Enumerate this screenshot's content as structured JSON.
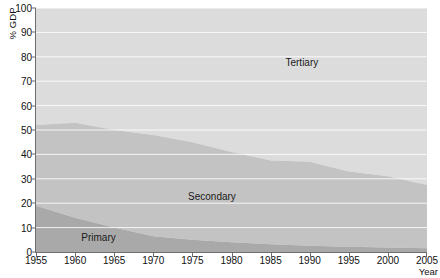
{
  "chart_data": {
    "type": "area",
    "stacked": true,
    "title": "",
    "xlabel": "Year",
    "ylabel": "% GDP",
    "xlim": [
      1955,
      2005
    ],
    "ylim": [
      0,
      100
    ],
    "ytick_step": 10,
    "xtick_step": 5,
    "grid": true,
    "grid_orientation": "horizontal",
    "legend_position": "inline-labels",
    "x": [
      1955,
      1960,
      1965,
      1970,
      1975,
      1980,
      1985,
      1990,
      1995,
      2000,
      2005
    ],
    "xtick_labels": [
      "1955",
      "1960",
      "1965",
      "1970",
      "1975",
      "1980",
      "1985",
      "1990",
      "1995",
      "2000",
      "2005"
    ],
    "ytick_labels": [
      "0",
      "10",
      "20",
      "30",
      "40",
      "50",
      "60",
      "70",
      "80",
      "90",
      "100"
    ],
    "series": [
      {
        "name": "Primary",
        "color": "#a9a9a9",
        "values": [
          19.0,
          14.0,
          10.0,
          6.5,
          5.0,
          4.0,
          3.2,
          2.6,
          2.2,
          1.8,
          1.5
        ]
      },
      {
        "name": "Secondary",
        "color": "#c3c3c3",
        "values": [
          33.0,
          39.0,
          40.0,
          41.5,
          40.0,
          37.0,
          34.3,
          34.4,
          30.8,
          29.2,
          26.0
        ]
      },
      {
        "name": "Tertiary",
        "color": "#dcdcdc",
        "values": [
          48.0,
          47.0,
          50.0,
          52.0,
          55.0,
          59.0,
          62.5,
          63.0,
          67.0,
          69.0,
          72.5
        ]
      }
    ],
    "cumulative_boundaries": {
      "primary_top": [
        19.0,
        14.0,
        10.0,
        6.5,
        5.0,
        4.0,
        3.2,
        2.6,
        2.2,
        1.8,
        1.5
      ],
      "secondary_top": [
        52.0,
        53.0,
        50.0,
        48.0,
        45.0,
        41.0,
        37.5,
        37.0,
        33.0,
        31.0,
        27.5
      ]
    },
    "series_labels": [
      {
        "text": "Primary",
        "x": 1963.0,
        "y": 6.0
      },
      {
        "text": "Secondary",
        "x": 1977.5,
        "y": 23.0
      },
      {
        "text": "Tertiary",
        "x": 1989.0,
        "y": 78.0
      }
    ]
  },
  "background_showthrough": {
    "line1": "The sustainable",
    "line2": "management of resources"
  }
}
